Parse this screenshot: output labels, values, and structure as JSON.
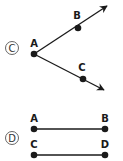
{
  "figure_c": {
    "option_label": "C",
    "points": {
      "A": "A",
      "B": "B",
      "C": "C"
    },
    "description": "Two rays from common endpoint A: ray AB and ray AC (angle)"
  },
  "figure_d": {
    "option_label": "D",
    "points": {
      "A": "A",
      "B": "B",
      "C": "C",
      "D": "D"
    },
    "description": "Two parallel line segments AB and CD"
  },
  "colors": {
    "ink": "#1a1a1a",
    "background": "#ffffff"
  }
}
